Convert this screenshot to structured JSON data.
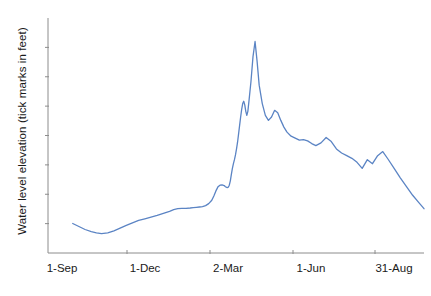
{
  "chart_data": {
    "type": "line",
    "title": "",
    "xlabel": "",
    "ylabel": "Water level elevation (tick marks in feet)",
    "grid": false,
    "legend": null,
    "line_color": "#5B84C4",
    "axis_color": "#808080",
    "background": "#ffffff",
    "x_tick_labels": [
      "1-Sep",
      "1-Dec",
      "2-Mar",
      "1-Jun",
      "31-Aug"
    ],
    "x_tick_positions_px": [
      62,
      145,
      228,
      311,
      394
    ],
    "x_axis_ticks_drawn_px": [
      127,
      210,
      293,
      375
    ],
    "y_tick_count": 7,
    "y_tick_labels": [],
    "note": "Y axis is unlabeled; tick marks denote feet of elevation at equal intervals.",
    "xlim": [
      0,
      365
    ],
    "ylim": [
      0,
      7
    ],
    "series": [
      {
        "name": "Water level elevation",
        "x": [
          24,
          30,
          36,
          42,
          47,
          52,
          58,
          64,
          70,
          76,
          82,
          88,
          94,
          100,
          106,
          112,
          118,
          122,
          126,
          130,
          134,
          138,
          141,
          144,
          147,
          150,
          153,
          156,
          159,
          161,
          163,
          165,
          167,
          169,
          171,
          172,
          173,
          174,
          175,
          176,
          177,
          178,
          179,
          180,
          181,
          182,
          183,
          184,
          185,
          186,
          187,
          188,
          189,
          190,
          191,
          192,
          193,
          194,
          195,
          197,
          199,
          201,
          203,
          205,
          208,
          211,
          214,
          217,
          220,
          223,
          226,
          229,
          232,
          236,
          240,
          244,
          248,
          252,
          256,
          260,
          265,
          270,
          275,
          280,
          285,
          290,
          295,
          300,
          305,
          310,
          315,
          320,
          325,
          330,
          336,
          342,
          348,
          354,
          360,
          365
        ],
        "y": [
          0.88,
          0.79,
          0.7,
          0.64,
          0.6,
          0.58,
          0.6,
          0.66,
          0.74,
          0.82,
          0.9,
          0.97,
          1.02,
          1.07,
          1.12,
          1.18,
          1.24,
          1.29,
          1.32,
          1.33,
          1.33,
          1.34,
          1.35,
          1.36,
          1.37,
          1.38,
          1.41,
          1.47,
          1.57,
          1.7,
          1.85,
          1.97,
          2.02,
          2.03,
          2.01,
          1.98,
          1.96,
          1.95,
          1.96,
          2.02,
          2.15,
          2.34,
          2.52,
          2.66,
          2.78,
          2.92,
          3.1,
          3.3,
          3.55,
          3.8,
          4.05,
          4.28,
          4.45,
          4.52,
          4.41,
          4.22,
          4.1,
          4.22,
          4.5,
          5.1,
          5.85,
          6.3,
          5.7,
          5.0,
          4.45,
          4.1,
          3.95,
          4.05,
          4.25,
          4.18,
          3.95,
          3.75,
          3.6,
          3.48,
          3.42,
          3.36,
          3.38,
          3.34,
          3.26,
          3.2,
          3.28,
          3.44,
          3.32,
          3.1,
          2.98,
          2.9,
          2.82,
          2.7,
          2.52,
          2.78,
          2.66,
          2.9,
          3.02,
          2.8,
          2.52,
          2.24,
          1.98,
          1.72,
          1.5,
          1.32
        ]
      }
    ]
  },
  "axis": {
    "y_axis_title": "Water level elevation (tick marks in feet)"
  },
  "x_labels": {
    "t0": "1-Sep",
    "t1": "1-Dec",
    "t2": "2-Mar",
    "t3": "1-Jun",
    "t4": "31-Aug"
  }
}
